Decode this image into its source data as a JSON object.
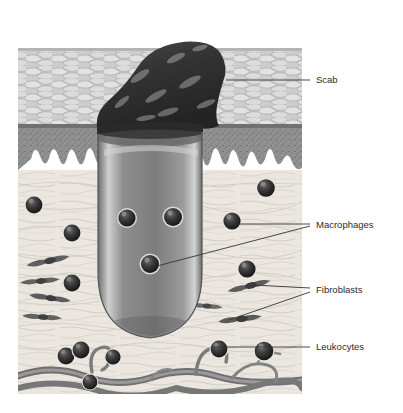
{
  "figure": {
    "style": "grayscale medical illustration",
    "border_color": "#555555",
    "background_color": "#ffffff",
    "label_text_color": "#2b2b2b",
    "leader_line_color": "#333333",
    "plate": {
      "x": 17,
      "y": 24,
      "width": 286,
      "height": 371
    }
  },
  "layers": [
    {
      "name": "epidermis",
      "label": "epidermis",
      "fill": "#c9c9c9",
      "y": 48,
      "height": 78,
      "texture": "basket-weave lens pattern"
    },
    {
      "name": "stratum-basale",
      "label": "stratum basale",
      "fill": "#8d8d8d",
      "y": 126,
      "height": 36,
      "texture": "stippled dark band"
    },
    {
      "name": "dermis",
      "label": "dermis",
      "fill": "#ebe8e2",
      "y": 162,
      "height": 210,
      "texture": "wavy collagen fibers"
    },
    {
      "name": "vessel-band",
      "label": "blood vessels",
      "fill": "#8a8a8a",
      "y": 352,
      "height": 42,
      "texture": "wavy tubular vessels"
    }
  ],
  "structures": [
    {
      "name": "scab",
      "label": "Scab",
      "fill": "#3a3a3a",
      "description": "dark irregular crust above epidermis"
    },
    {
      "name": "wound-plug",
      "label": "wound plug",
      "fill": "#8a8a8a",
      "description": "U-shaped granulation column descending into dermis"
    }
  ],
  "cells": {
    "macrophages": [
      {
        "cx": 127,
        "cy": 218,
        "r": 9
      },
      {
        "cx": 172,
        "cy": 217,
        "r": 9
      },
      {
        "cx": 150,
        "cy": 263,
        "r": 9
      },
      {
        "cx": 232,
        "cy": 220,
        "r": 9
      },
      {
        "cx": 266,
        "cy": 188,
        "r": 9
      },
      {
        "cx": 34,
        "cy": 205,
        "r": 9
      },
      {
        "cx": 247,
        "cy": 269,
        "r": 9
      },
      {
        "cx": 72,
        "cy": 232,
        "r": 9
      }
    ],
    "leukocytes": [
      {
        "cx": 72,
        "cy": 283,
        "r": 9
      },
      {
        "cx": 66,
        "cy": 355,
        "r": 9
      },
      {
        "cx": 79,
        "cy": 350,
        "r": 9
      },
      {
        "cx": 113,
        "cy": 356,
        "r": 8
      },
      {
        "cx": 219,
        "cy": 348,
        "r": 9
      },
      {
        "cx": 264,
        "cy": 351,
        "r": 10
      },
      {
        "cx": 90,
        "cy": 381,
        "r": 8
      }
    ],
    "fibroblasts": [
      {
        "cx": 48,
        "cy": 261,
        "rot": -12
      },
      {
        "cx": 40,
        "cy": 280,
        "rot": -6
      },
      {
        "cx": 50,
        "cy": 297,
        "rot": 8
      },
      {
        "cx": 42,
        "cy": 316,
        "rot": 4
      },
      {
        "cx": 248,
        "cy": 286,
        "rot": -14
      },
      {
        "cx": 240,
        "cy": 318,
        "rot": -8
      },
      {
        "cx": 205,
        "cy": 305,
        "rot": 6
      }
    ]
  },
  "annotations": [
    {
      "id": "scab",
      "name": "Scab",
      "label": "Scab",
      "text_x": 316,
      "text_y": 80,
      "leaders": [
        {
          "points": "226,80 310,80"
        }
      ]
    },
    {
      "id": "macrophages",
      "name": "Macrophages",
      "label": "Macrophages",
      "text_x": 316,
      "text_y": 225,
      "leaders": [
        {
          "points": "232,224 310,224"
        },
        {
          "points": "156,266 310,226"
        }
      ]
    },
    {
      "id": "fibroblasts",
      "name": "Fibroblasts",
      "label": "Fibroblasts",
      "text_x": 316,
      "text_y": 290,
      "leaders": [
        {
          "points": "252,286 310,288"
        },
        {
          "points": "228,320 310,292"
        }
      ]
    },
    {
      "id": "leukocytes",
      "name": "Leukocytes",
      "label": "Leukocytes",
      "text_x": 316,
      "text_y": 347,
      "leaders": [
        {
          "points": "215,347 310,347"
        }
      ]
    }
  ]
}
